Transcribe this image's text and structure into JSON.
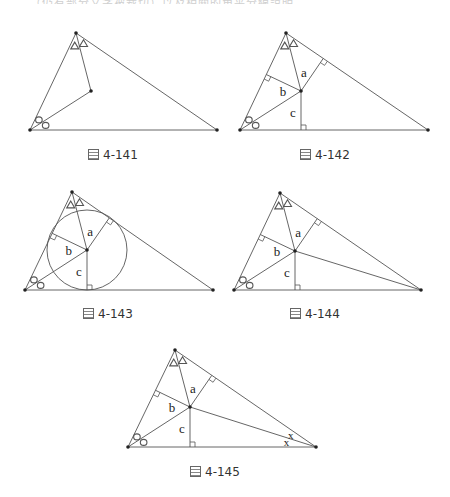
{
  "top_text": "（仍有部分文字被裁切）以及相關的角平分線說明",
  "figures": [
    {
      "id": "fig-4-141",
      "caption_prefix": "圖",
      "caption": "4-141",
      "A": [
        30,
        130
      ],
      "B": [
        76,
        33
      ],
      "C": [
        217,
        130
      ],
      "I": [
        91,
        91
      ],
      "segments": [
        "AI",
        "BI"
      ],
      "perps": [],
      "labels": [],
      "circle": false,
      "x_marks": false
    },
    {
      "id": "fig-4-142",
      "caption_prefix": "圖",
      "caption": "4-142",
      "A": [
        240,
        130
      ],
      "B": [
        286,
        33
      ],
      "C": [
        428,
        130
      ],
      "I": [
        301,
        91
      ],
      "segments": [
        "AI",
        "BI"
      ],
      "perps": [
        "a",
        "b",
        "c"
      ],
      "labels": [
        "a",
        "b",
        "c"
      ],
      "circle": false,
      "x_marks": false
    },
    {
      "id": "fig-4-143",
      "caption_prefix": "圖",
      "caption": "4-143",
      "A": [
        25,
        290
      ],
      "B": [
        72,
        192
      ],
      "C": [
        213,
        290
      ],
      "I": [
        87,
        250
      ],
      "segments": [
        "AI",
        "BI"
      ],
      "perps": [
        "a",
        "b",
        "c"
      ],
      "labels": [
        "a",
        "b",
        "c"
      ],
      "circle": true,
      "x_marks": false
    },
    {
      "id": "fig-4-144",
      "caption_prefix": "圖",
      "caption": "4-144",
      "A": [
        234,
        290
      ],
      "B": [
        280,
        193
      ],
      "C": [
        421,
        290
      ],
      "I": [
        295,
        251
      ],
      "segments": [
        "AI",
        "BI",
        "CI"
      ],
      "perps": [
        "a",
        "b",
        "c"
      ],
      "labels": [
        "a",
        "b",
        "c"
      ],
      "circle": false,
      "x_marks": false
    },
    {
      "id": "fig-4-145",
      "caption_prefix": "圖",
      "caption": "4-145",
      "A": [
        128,
        447
      ],
      "B": [
        175,
        350
      ],
      "C": [
        316,
        447
      ],
      "I": [
        190,
        407
      ],
      "segments": [
        "AI",
        "BI",
        "CI"
      ],
      "perps": [
        "a",
        "b",
        "c"
      ],
      "labels": [
        "a",
        "b",
        "c"
      ],
      "circle": false,
      "x_marks": true
    }
  ],
  "angle_marks": {
    "A": "circle",
    "B": "triangle",
    "C": "x"
  },
  "x_label": "x",
  "colors": {
    "line": "#555555",
    "point": "#222222",
    "text": "#222222"
  }
}
